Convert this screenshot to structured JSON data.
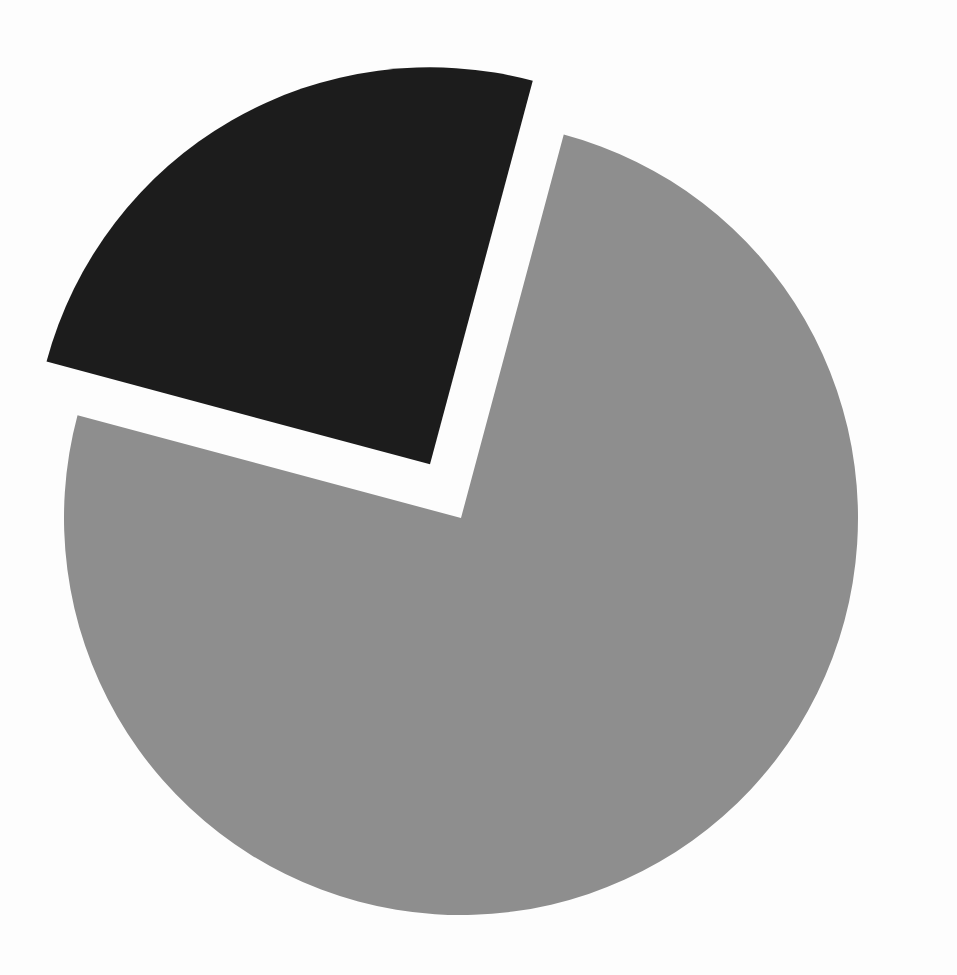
{
  "figure": {
    "background_color": "#fdfdfd",
    "width": 957,
    "height": 975,
    "title": "",
    "subtitle": "",
    "has_labels": false,
    "has_legend": false,
    "has_axes": false
  },
  "chart_data": {
    "type": "pie",
    "title": "",
    "subtitle": "",
    "xlabel": "",
    "ylabel": "",
    "grid": false,
    "legend": false,
    "legend_position": "none",
    "labels": [
      "Slice 1",
      "Slice 2"
    ],
    "values": [
      75,
      25
    ],
    "percentages": [
      "75%",
      "25%"
    ],
    "colors": [
      "#8e8e8e",
      "#1c1c1c"
    ],
    "start_angle_deg": 15,
    "direction": "clockwise",
    "explode": [
      0,
      0.16
    ],
    "annotations": [],
    "slices": [
      {
        "label": "Slice 1",
        "value": 75,
        "percentage": "75%",
        "color": "#8e8e8e",
        "start_angle_deg": 15,
        "end_angle_deg": 285,
        "exploded": false,
        "explode_offset_px": 0
      },
      {
        "label": "Slice 2",
        "value": 25,
        "percentage": "25%",
        "color": "#1c1c1c",
        "start_angle_deg": 285,
        "end_angle_deg": 375,
        "exploded": true,
        "explode_offset_px": 62
      }
    ]
  },
  "geometry": {
    "center_x": 461,
    "center_y": 518,
    "radius": 397
  }
}
